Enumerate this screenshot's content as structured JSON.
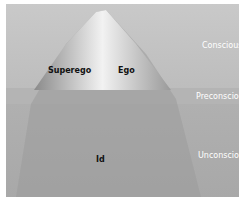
{
  "diagram": {
    "structures": {
      "superego": "Superego",
      "ego": "Ego",
      "id": "Id"
    },
    "levels": {
      "conscious": "Conscious",
      "preconscious": "Preconscious",
      "unconscious": "Unconscious"
    }
  }
}
